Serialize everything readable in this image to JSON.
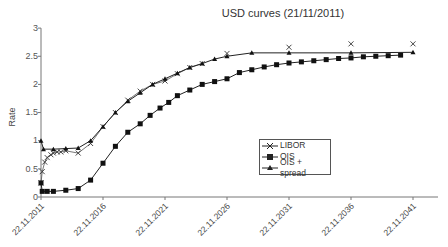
{
  "chart_data": {
    "type": "line",
    "title": "USD curves (21/11/2011)",
    "xlabel": "",
    "ylabel": "Rate",
    "ylim": [
      0,
      3
    ],
    "yticks": [
      "0",
      "0.5",
      "1",
      "1.5",
      "2",
      "2.5",
      "3"
    ],
    "xticks": [
      "22.11.2011",
      "22.11.2016",
      "22.11.2021",
      "22.11.2026",
      "22.11.2031",
      "22.11.2036",
      "22.11.2041"
    ],
    "grid": false,
    "legend_position": "center-right",
    "series": [
      {
        "name": "LIBOR",
        "marker": "x",
        "x": [
          2011.0,
          2011.1,
          2011.3,
          2011.5,
          2011.8,
          2012.0,
          2012.3,
          2012.6,
          2013.0,
          2014.0,
          2015.0,
          2016.0,
          2017.0,
          2018.0,
          2019.0,
          2020.0,
          2021.0,
          2022.0,
          2023.0,
          2024.0,
          2026.0,
          2031.0,
          2036.0,
          2041.0
        ],
        "values": [
          0.25,
          0.45,
          0.62,
          0.7,
          0.75,
          0.78,
          0.8,
          0.8,
          0.82,
          0.78,
          0.95,
          1.25,
          1.5,
          1.72,
          1.88,
          2.0,
          2.06,
          2.19,
          2.3,
          2.37,
          2.55,
          2.66,
          2.72,
          2.72
        ]
      },
      {
        "name": "OIS",
        "marker": "square",
        "x": [
          2011.0,
          2011.1,
          2011.5,
          2012.0,
          2013.0,
          2014.0,
          2015.0,
          2016.0,
          2017.0,
          2018.0,
          2019.0,
          2019.8,
          2020.6,
          2021.3,
          2022.0,
          2023.0,
          2024.0,
          2025.0,
          2026.0,
          2027.0,
          2028.0,
          2029.0,
          2030.0,
          2031.0,
          2032.0,
          2033.0,
          2034.0,
          2035.0,
          2036.0,
          2037.0,
          2038.0,
          2039.0,
          2040.0
        ],
        "values": [
          0.25,
          0.1,
          0.1,
          0.1,
          0.12,
          0.15,
          0.3,
          0.6,
          0.9,
          1.15,
          1.3,
          1.45,
          1.58,
          1.68,
          1.8,
          1.9,
          2.0,
          2.05,
          2.1,
          2.21,
          2.26,
          2.31,
          2.35,
          2.38,
          2.4,
          2.42,
          2.44,
          2.46,
          2.47,
          2.49,
          2.5,
          2.51,
          2.52
        ]
      },
      {
        "name": "OIS + spread",
        "marker": "triangle",
        "x": [
          2011.0,
          2011.2,
          2012.0,
          2013.0,
          2014.0,
          2015.0,
          2016.0,
          2017.0,
          2018.0,
          2019.0,
          2020.0,
          2021.0,
          2022.0,
          2023.0,
          2024.0,
          2025.0,
          2026.0,
          2028.0,
          2031.0,
          2036.0,
          2041.0
        ],
        "values": [
          1.0,
          0.85,
          0.85,
          0.86,
          0.87,
          1.0,
          1.25,
          1.5,
          1.7,
          1.85,
          2.0,
          2.1,
          2.2,
          2.3,
          2.37,
          2.45,
          2.5,
          2.56,
          2.56,
          2.56,
          2.57
        ]
      }
    ]
  }
}
